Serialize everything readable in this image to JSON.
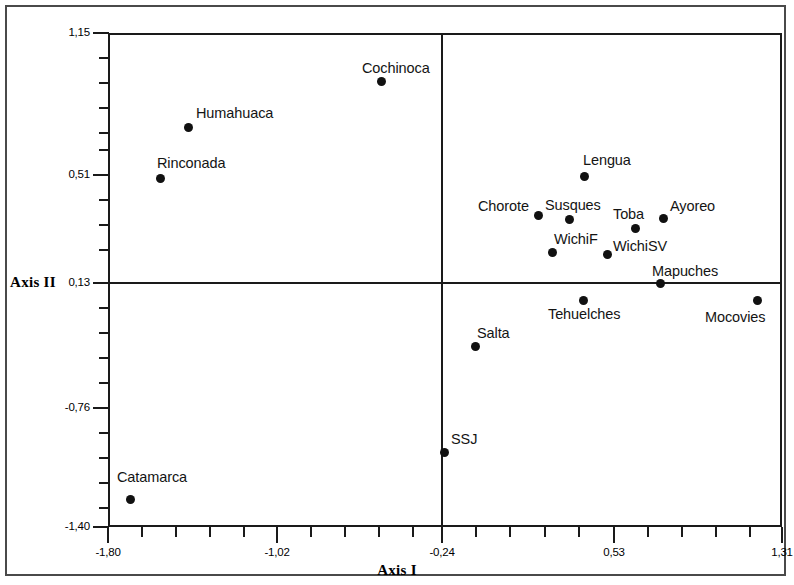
{
  "figure": {
    "title": "",
    "axis_i_label": "Axis I",
    "axis_ii_label": "Axis II"
  },
  "chart_data": {
    "type": "scatter",
    "title": "",
    "xlabel": "Axis I",
    "ylabel": "Axis II",
    "xlim": [
      -1.8,
      1.31
    ],
    "ylim": [
      -1.4,
      1.15
    ],
    "grid": false,
    "legend": null,
    "x_tick_labels": [
      "-1,80",
      "-1,02",
      "-0,24",
      "0,53",
      "1,31"
    ],
    "x_tick_values": [
      -1.8,
      -1.02,
      -0.24,
      0.53,
      1.31
    ],
    "y_tick_labels": [
      "1,15",
      "0,51",
      "0,13",
      "-0,76",
      "-1,40"
    ],
    "y_tick_values": [
      1.15,
      0.51,
      0.13,
      -0.76,
      -1.4
    ],
    "reference_lines": {
      "vertical_x": -0.24,
      "horizontal_y": 0.13
    },
    "points": [
      {
        "label": "Cochinoca",
        "x": -0.54,
        "y": 0.93,
        "label_pos": "above"
      },
      {
        "label": "Humahuaca",
        "x": -1.43,
        "y": 0.67,
        "label_pos": "right-above"
      },
      {
        "label": "Rinconada",
        "x": -1.56,
        "y": 0.41,
        "label_pos": "right-above"
      },
      {
        "label": "Lengua",
        "x": 0.4,
        "y": 0.43,
        "label_pos": "right-above"
      },
      {
        "label": "Chorote",
        "x": 0.19,
        "y": 0.23,
        "label_pos": "left-above"
      },
      {
        "label": "Susques",
        "x": 0.33,
        "y": 0.21,
        "label_pos": "right-above"
      },
      {
        "label": "Toba",
        "x": 0.64,
        "y": 0.16,
        "label_pos": "left-above"
      },
      {
        "label": "Ayoreo",
        "x": 0.77,
        "y": 0.21,
        "label_pos": "right-above"
      },
      {
        "label": "WichiF",
        "x": 0.25,
        "y": 0.06,
        "label_pos": "right-above"
      },
      {
        "label": "WichiSV",
        "x": 0.5,
        "y": 0.05,
        "label_pos": "right-above"
      },
      {
        "label": "Mapuches",
        "x": 0.74,
        "y": 0.13,
        "label_pos": "right-above"
      },
      {
        "label": "Tehuelches",
        "x": 0.38,
        "y": 0.04,
        "label_pos": "below"
      },
      {
        "label": "Mocovies",
        "x": 1.18,
        "y": 0.04,
        "label_pos": "below-left"
      },
      {
        "label": "Salta",
        "x": -0.09,
        "y": -0.3,
        "label_pos": "right-above"
      },
      {
        "label": "SSJ",
        "x": -0.24,
        "y": -0.85,
        "label_pos": "right-above"
      },
      {
        "label": "Catamarca",
        "x": -1.7,
        "y": -1.09,
        "label_pos": "right-above"
      }
    ]
  },
  "axes": {
    "y_ticks": [
      {
        "label": "1,15",
        "top": 33
      },
      {
        "label": "0,51",
        "top": 175
      },
      {
        "label": "0,13",
        "top": 283
      },
      {
        "label": "-0,76",
        "top": 408
      },
      {
        "label": "-1,40",
        "top": 527
      }
    ],
    "x_ticks": [
      {
        "label": "-1,80",
        "left": 108
      },
      {
        "label": "-1,02",
        "left": 277
      },
      {
        "left_only": true,
        "label": "-0,24",
        "left": 442
      },
      {
        "label": "0,53",
        "left": 614
      },
      {
        "label": "1,31",
        "left": 782
      }
    ]
  },
  "points_px": [
    {
      "label": "Cochinoca",
      "cx": 381,
      "cy": 81,
      "lx": 362,
      "ly": 60
    },
    {
      "label": "Humahuaca",
      "cx": 188,
      "cy": 127,
      "lx": 196,
      "ly": 105
    },
    {
      "label": "Rinconada",
      "cx": 160,
      "cy": 178,
      "lx": 157,
      "ly": 155
    },
    {
      "label": "Lengua",
      "cx": 584,
      "cy": 176,
      "lx": 583,
      "ly": 152
    },
    {
      "label": "Chorote",
      "cx": 538,
      "cy": 215,
      "lx": 478,
      "ly": 198
    },
    {
      "label": "Susques",
      "cx": 569,
      "cy": 219,
      "lx": 545,
      "ly": 197
    },
    {
      "label": "Toba",
      "cx": 635,
      "cy": 228,
      "lx": 613,
      "ly": 206
    },
    {
      "label": "Ayoreo",
      "cx": 663,
      "cy": 218,
      "lx": 670,
      "ly": 198
    },
    {
      "label": "WichiF",
      "cx": 552,
      "cy": 252,
      "lx": 554,
      "ly": 231
    },
    {
      "label": "WichiSV",
      "cx": 607,
      "cy": 254,
      "lx": 613,
      "ly": 238
    },
    {
      "label": "Mapuches",
      "cx": 660,
      "cy": 283,
      "lx": 652,
      "ly": 263
    },
    {
      "label": "Tehuelches",
      "cx": 583,
      "cy": 300,
      "lx": 548,
      "ly": 306
    },
    {
      "label": "Mocovies",
      "cx": 757,
      "cy": 300,
      "lx": 705,
      "ly": 309
    },
    {
      "label": "Salta",
      "cx": 475,
      "cy": 346,
      "lx": 477,
      "ly": 325
    },
    {
      "label": "SSJ",
      "cx": 444,
      "cy": 452,
      "lx": 451,
      "ly": 431
    },
    {
      "label": "Catamarca",
      "cx": 130,
      "cy": 499,
      "lx": 117,
      "ly": 469
    }
  ],
  "tick_grid": {
    "y_minor_tops": [
      58,
      83,
      108,
      133,
      150,
      200,
      225,
      250,
      308,
      333,
      358,
      383,
      433,
      458,
      483,
      508
    ],
    "x_minor_lefts": [
      142,
      176,
      210,
      244,
      311,
      345,
      379,
      413,
      476,
      510,
      545,
      579,
      648,
      682,
      716,
      750
    ]
  }
}
